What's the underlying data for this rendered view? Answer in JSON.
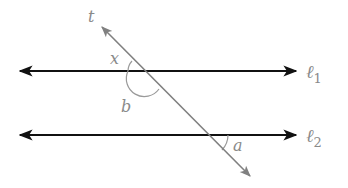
{
  "diagram": {
    "lines": [
      {
        "id": "l1",
        "label": "ℓ",
        "subscript": "1",
        "y": 71,
        "x1": 18,
        "x2": 297,
        "color": "#111111"
      },
      {
        "id": "l2",
        "label": "ℓ",
        "subscript": "2",
        "y": 135,
        "x1": 18,
        "x2": 297,
        "color": "#111111"
      }
    ],
    "transversal": {
      "label": "t",
      "x1": 100,
      "y1": 25,
      "x2": 252,
      "y2": 178,
      "color": "#808080"
    },
    "angles": [
      {
        "label": "x",
        "position": "above-left of intersection with ℓ1"
      },
      {
        "label": "b",
        "position": "below-left of intersection with ℓ1 (arc)"
      },
      {
        "label": "a",
        "position": "below-right of intersection with ℓ2"
      }
    ]
  }
}
